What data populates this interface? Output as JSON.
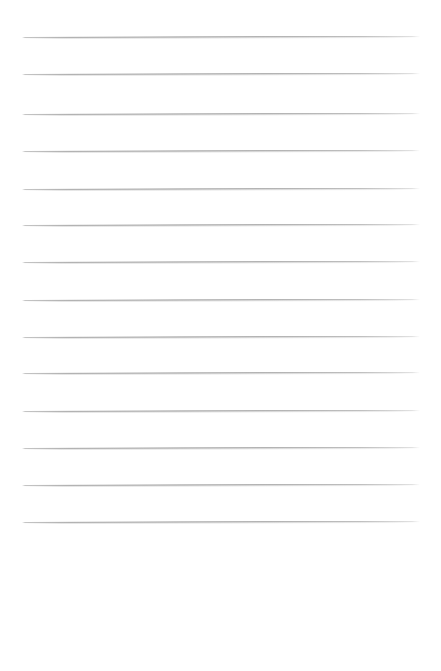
{
  "page": {
    "kind": "scanned-lined-paper",
    "width_px": 441,
    "height_px": 671,
    "background_color": "#ffffff",
    "content_text": "",
    "has_handwriting": false,
    "has_header_text": false,
    "has_page_number": false
  },
  "ruling": {
    "line_color": "#b4b4b4",
    "line_thickness_px": 1,
    "line_count": 14,
    "line_left_x_px": 22,
    "line_right_x_px": 420,
    "line_length_px": 398,
    "first_line_y_px": 37,
    "last_line_y_px": 522,
    "line_spacing_px": 37.3,
    "skew_degrees": -0.16,
    "lines": [
      {
        "index": 1,
        "y": 37,
        "label": "ruled-line-1",
        "content": ""
      },
      {
        "index": 2,
        "y": 74,
        "label": "ruled-line-2",
        "content": ""
      },
      {
        "index": 3,
        "y": 114,
        "label": "ruled-line-3",
        "content": ""
      },
      {
        "index": 4,
        "y": 151,
        "label": "ruled-line-4",
        "content": ""
      },
      {
        "index": 5,
        "y": 189,
        "label": "ruled-line-5",
        "content": ""
      },
      {
        "index": 6,
        "y": 225,
        "label": "ruled-line-6",
        "content": ""
      },
      {
        "index": 7,
        "y": 262,
        "label": "ruled-line-7",
        "content": ""
      },
      {
        "index": 8,
        "y": 300,
        "label": "ruled-line-8",
        "content": ""
      },
      {
        "index": 9,
        "y": 337,
        "label": "ruled-line-9",
        "content": ""
      },
      {
        "index": 10,
        "y": 373,
        "label": "ruled-line-10",
        "content": ""
      },
      {
        "index": 11,
        "y": 411,
        "label": "ruled-line-11",
        "content": ""
      },
      {
        "index": 12,
        "y": 448,
        "label": "ruled-line-12",
        "content": ""
      },
      {
        "index": 13,
        "y": 485,
        "label": "ruled-line-13",
        "content": ""
      },
      {
        "index": 14,
        "y": 522,
        "label": "ruled-line-14",
        "content": ""
      }
    ]
  },
  "margins": {
    "top_px": 37,
    "left_px": 22,
    "right_px": 21,
    "bottom_blank_start_y_px": 525,
    "bottom_blank_height_px": 146
  }
}
